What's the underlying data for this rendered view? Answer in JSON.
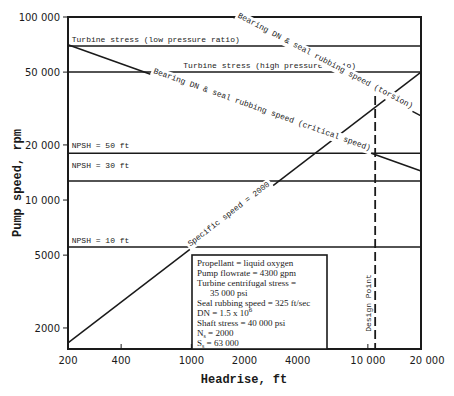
{
  "chart_data": {
    "type": "line",
    "title": "",
    "xlabel": "Headrise, ft",
    "ylabel": "Pump speed, rpm",
    "xscale": "log",
    "yscale": "log",
    "xlim": [
      200,
      20000
    ],
    "ylim": [
      1535,
      100000
    ],
    "grid": false,
    "x_ticks": [
      {
        "value": 200,
        "label": "200"
      },
      {
        "value": 400,
        "label": "400"
      },
      {
        "value": 1000,
        "label": "1000"
      },
      {
        "value": 2000,
        "label": "2000"
      },
      {
        "value": 4000,
        "label": "4000"
      },
      {
        "value": 10000,
        "label": "10 000"
      },
      {
        "value": 20000,
        "label": "20 000"
      }
    ],
    "y_ticks": [
      {
        "value": 2000,
        "label": "2000"
      },
      {
        "value": 5000,
        "label": "5000"
      },
      {
        "value": 10000,
        "label": "10 000"
      },
      {
        "value": 20000,
        "label": "20 000"
      },
      {
        "value": 50000,
        "label": "50 000"
      },
      {
        "value": 100000,
        "label": "100 000"
      }
    ],
    "series": [
      {
        "name": "Turbine stress (low pressure ratio)",
        "label": "Turbine stress (low pressure ratio)",
        "x": [
          200,
          20000
        ],
        "y": [
          69500,
          69500
        ]
      },
      {
        "name": "Turbine stress (high pressure ratio)",
        "label": "Turbine stress (high pressure ratio)",
        "x": [
          200,
          20000
        ],
        "y": [
          50000,
          50000
        ]
      },
      {
        "name": "Bearing DN & seal rubbing speed (torsion)",
        "label": "Bearing DN & seal rubbing speed (torsion)",
        "x": [
          1720,
          20000
        ],
        "y": [
          100000,
          28800
        ]
      },
      {
        "name": "Bearing DN & seal rubbing speed (critical speed)",
        "label": "Bearing DN & seal rubbing speed (critical speed)",
        "x": [
          200,
          20000
        ],
        "y": [
          70500,
          14400
        ]
      },
      {
        "name": "NPSH = 50 ft",
        "label": "NPSH = 50 ft",
        "x": [
          200,
          20000
        ],
        "y": [
          18000,
          18000
        ]
      },
      {
        "name": "NPSH = 30 ft",
        "label": "NPSH = 30 ft",
        "x": [
          200,
          20000
        ],
        "y": [
          12700,
          12700
        ]
      },
      {
        "name": "NPSH = 10 ft",
        "label": "NPSH = 10 ft",
        "x": [
          200,
          20000
        ],
        "y": [
          5530,
          5530
        ]
      },
      {
        "name": "Specific speed = 2000",
        "label": "Specific speed = 2000",
        "x": [
          200,
          20000
        ],
        "y": [
          1660,
          50000
        ]
      }
    ],
    "annotations": [
      {
        "type": "vline",
        "name": "Design Point",
        "label": "Design Point",
        "x": 11000,
        "y_range": [
          1535,
          37000
        ],
        "style": "dashed"
      }
    ],
    "legend": {
      "placement": "bottom-center",
      "lines": [
        "Propellant = liquid oxygen",
        "Pump flowrate = 4300 gpm",
        "Turbine centrifugal stress =",
        "35 000 psi",
        "Seal rubbing speed = 325 ft/sec",
        "DN = 1.5 x 10",
        "Shaft stress = 40 000 psi",
        "N",
        "S"
      ],
      "dn_exponent": "6",
      "ns_sub": "s",
      "ns_value": " = 2000",
      "ss_sub": "s",
      "ss_value": " = 63 000"
    }
  }
}
